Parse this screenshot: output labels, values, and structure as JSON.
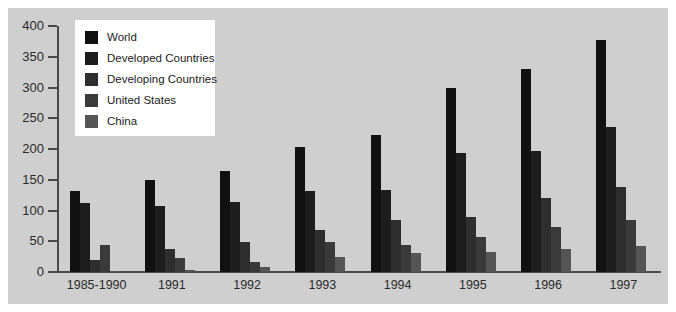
{
  "chart_data": {
    "type": "bar",
    "title": "",
    "subtitle": "",
    "xlabel": "",
    "ylabel": "",
    "ylim": [
      0,
      400
    ],
    "y_ticks": [
      0,
      50,
      100,
      150,
      200,
      250,
      300,
      350,
      400
    ],
    "grid": false,
    "legend_position": "top-left",
    "categories": [
      "1985-1990",
      "1991",
      "1992",
      "1993",
      "1994",
      "1995",
      "1996",
      "1997"
    ],
    "series": [
      {
        "name": "World",
        "color": "#111111",
        "values": [
          132,
          150,
          164,
          204,
          223,
          300,
          330,
          378
        ]
      },
      {
        "name": "Developed Countries",
        "color": "#1d1d1d",
        "values": [
          112,
          108,
          114,
          131,
          133,
          193,
          196,
          236
        ]
      },
      {
        "name": "Developing Countries",
        "color": "#2e2e2e",
        "values": [
          20,
          38,
          48,
          68,
          84,
          90,
          120,
          139
        ]
      },
      {
        "name": "United States",
        "color": "#3a3a3a",
        "values": [
          44,
          23,
          17,
          48,
          44,
          57,
          73,
          85
        ]
      },
      {
        "name": "China",
        "color": "#555555",
        "values": [
          2,
          3,
          8,
          25,
          31,
          33,
          37,
          43
        ]
      }
    ]
  },
  "axes": {
    "y_tick_labels": [
      "400",
      "350",
      "300",
      "250",
      "200",
      "150",
      "100",
      "50",
      "0"
    ],
    "x_tick_labels": [
      "1985-1990",
      "1991",
      "1992",
      "1993",
      "1994",
      "1995",
      "1996",
      "1997"
    ]
  },
  "legend": {
    "entries": [
      {
        "label": "World",
        "color": "#111111"
      },
      {
        "label": "Developed Countries",
        "color": "#1d1d1d"
      },
      {
        "label": "Developing Countries",
        "color": "#2e2e2e"
      },
      {
        "label": "United States",
        "color": "#3a3a3a"
      },
      {
        "label": "China",
        "color": "#555555"
      }
    ]
  },
  "style": {
    "plate_background": "#cfcfcf",
    "page_background": "#ffffff",
    "axis_color": "#4a4a4a",
    "text_color": "#2b2b2b"
  }
}
